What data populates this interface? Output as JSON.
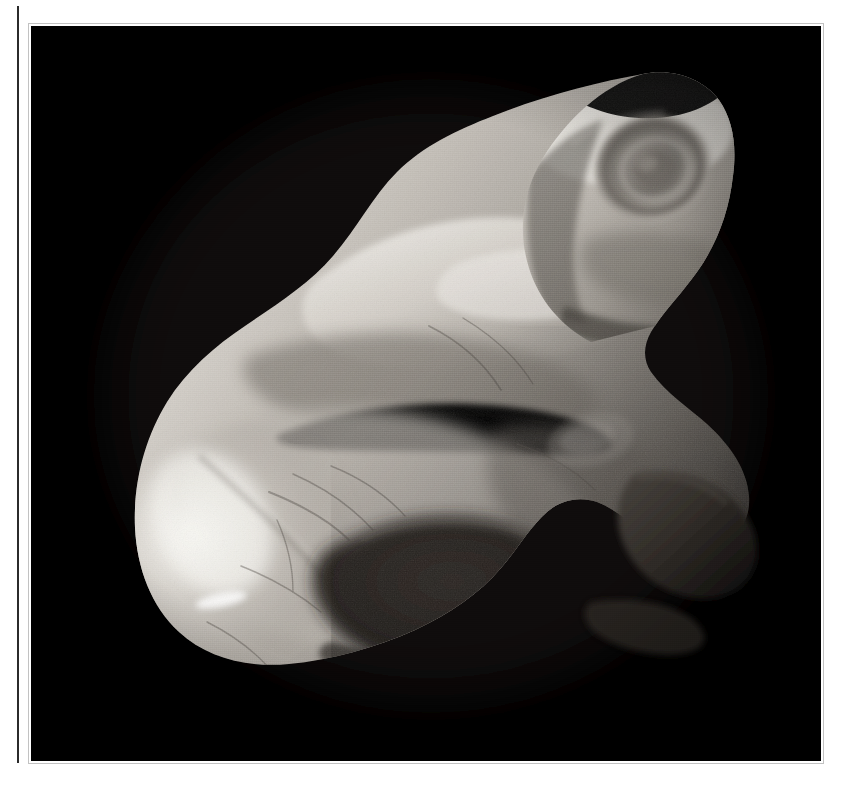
{
  "page": {
    "background_color": "#ffffff",
    "width": 841,
    "height": 788
  },
  "gutter_rule": {
    "name": "vertical-rule",
    "color": "#2b2b2b"
  },
  "plate": {
    "name": "photographic-plate",
    "background_color": "#000000",
    "caption": "",
    "x": 31,
    "y": 26,
    "width": 790,
    "height": 735
  },
  "subject": {
    "kind": "carved-stone-sculpture",
    "description": "Zoomorphic carved stone figure photographed against a black ground",
    "alt_text": "A pale carved stone sculpture of a crouching animal figure, lit from the left, shown against a solid black background.",
    "material_tone": "pale grey-white stone",
    "lighting": "raking light from upper left",
    "features": [
      {
        "name": "head",
        "note": "upper right, saddle-notched crown with two raised points"
      },
      {
        "name": "eye-spiral",
        "note": "concentric carved oval on the right side of the head"
      },
      {
        "name": "shoulder-ridge",
        "note": "bright diagonal facet across the upper body"
      },
      {
        "name": "crevice",
        "note": "dark horizontal fissure separating upper and lower masses"
      },
      {
        "name": "haunch",
        "note": "large shadowed rounded form in the lower centre"
      },
      {
        "name": "rear-limb",
        "note": "dark protruding wedge on the right flank"
      },
      {
        "name": "highlight",
        "note": "brightest specular area on the left of the lower body"
      }
    ],
    "tones": {
      "highlight": "#f2f0ec",
      "light": "#cfcac4",
      "mid": "#a49f99",
      "midshadow": "#7b766f",
      "shadow": "#4a4641",
      "deep_shadow": "#241f1c",
      "background": "#000000"
    }
  }
}
